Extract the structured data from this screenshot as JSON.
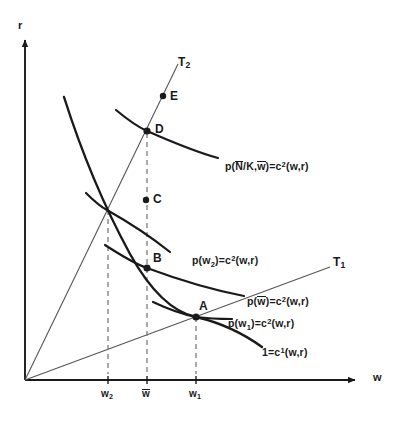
{
  "figure": {
    "type": "economics-diagram",
    "axes": {
      "y_label": "r",
      "x_label": "w",
      "origin": [
        25,
        380
      ]
    },
    "ticks": [
      {
        "name": "w-2",
        "label_html": "w<sub>2</sub>",
        "x": 108,
        "text": "w2"
      },
      {
        "name": "w-bar",
        "label_html": "w̄",
        "x": 147,
        "text": "w̄"
      },
      {
        "name": "w-1",
        "label_html": "w<sub>1</sub>",
        "x": 196,
        "text": "w1"
      }
    ],
    "rays": [
      {
        "name": "T1",
        "label": "T",
        "sub": "1",
        "label_x": 333,
        "label_y": 256
      },
      {
        "name": "T2",
        "label": "T",
        "sub": "2",
        "label_x": 178,
        "label_y": 56
      }
    ],
    "points": [
      {
        "name": "A",
        "label": "A",
        "x": 196,
        "y": 317,
        "label_x": 199,
        "label_y": 300
      },
      {
        "name": "B",
        "label": "B",
        "x": 147,
        "y": 268,
        "label_x": 153,
        "label_y": 252
      },
      {
        "name": "C",
        "label": "C",
        "x": 146,
        "y": 200,
        "label_x": 153,
        "label_y": 193
      },
      {
        "name": "D",
        "label": "D",
        "x": 147,
        "y": 131,
        "label_x": 155,
        "label_y": 123
      },
      {
        "name": "E",
        "label": "E",
        "x": 163,
        "y": 96,
        "label_x": 170,
        "label_y": 90
      }
    ],
    "curve_labels": [
      {
        "name": "p-nbar-k-wbar",
        "html": "p(<span class=\"ovl\">N<span class=\"bar\"></span></span>/K,<span class=\"ovl\">w<span class=\"bar\"></span></span>)=c<sup>2</sup>(w,r)",
        "text": "p(N̄/K,w̄)=c2(w,r)",
        "x": 225,
        "y": 161
      },
      {
        "name": "p-w2",
        "html": "p(w<sub>2</sub>)=c<sup>2</sup>(w,r)",
        "text": "p(w2)=c2(w,r)",
        "x": 192,
        "y": 255
      },
      {
        "name": "p-wbar",
        "html": "p(<span class=\"ovl\">w<span class=\"bar\"></span></span>)=c<sup>2</sup>(w,r)",
        "text": "p(w̄)=c2(w,r)",
        "x": 247,
        "y": 296
      },
      {
        "name": "p-w1",
        "html": "p(w<sub>1</sub>)=c<sup>2</sup>(w,r)",
        "text": "p(w1)=c2(w,r)",
        "x": 228,
        "y": 318
      },
      {
        "name": "unit-cost-c1",
        "html": "1=c<sup>1</sup>(w,r)",
        "text": "1=c1(w,r)",
        "x": 262,
        "y": 347
      }
    ],
    "colors": {
      "ink": "#1a1a1a",
      "curve": "#1a1a1a",
      "ray": "#555555",
      "dashed": "#777777",
      "background": "#ffffff"
    }
  }
}
